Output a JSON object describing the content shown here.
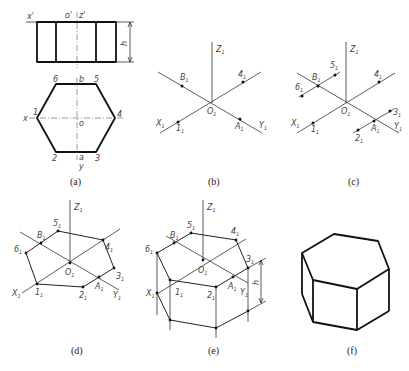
{
  "figure": {
    "panels": [
      {
        "id": "a",
        "caption": "(a)",
        "description": "Orthographic front and top views of hexagonal prism",
        "front_view_labels": {
          "x": "x'",
          "o": "o'",
          "z": "z'",
          "height": "h"
        },
        "top_view_labels": {
          "v1": "1",
          "v2": "2",
          "v3": "3",
          "v4": "4",
          "v5": "5",
          "v6": "6",
          "x": "x",
          "y": "y",
          "o": "o",
          "a": "a",
          "b": "b"
        }
      },
      {
        "id": "b",
        "caption": "(b)",
        "description": "Isometric axes with points B1, 4, 1, A1",
        "labels": {
          "z": "Z",
          "x": "X",
          "y": "Y",
          "o": "O",
          "b": "B",
          "a": "A",
          "p1": "1",
          "p4": "4"
        }
      },
      {
        "id": "c",
        "caption": "(c)",
        "description": "Lines through B1 and A1 parallel to X axis locate 5, 6, 2, 3",
        "labels": {
          "z": "Z",
          "x": "X",
          "y": "Y",
          "o": "O",
          "b": "B",
          "a": "A",
          "p1": "1",
          "p2": "2",
          "p3": "3",
          "p4": "4",
          "p5": "5",
          "p6": "6"
        }
      },
      {
        "id": "d",
        "caption": "(d)",
        "description": "Top hexagon connected in isometric",
        "labels": {
          "z": "Z",
          "x": "X",
          "y": "Y",
          "o": "O",
          "b": "B",
          "a": "A",
          "p1": "1",
          "p2": "2",
          "p3": "3",
          "p4": "4",
          "p5": "5",
          "p6": "6"
        }
      },
      {
        "id": "e",
        "caption": "(e)",
        "description": "Vertical edges drawn down by height h",
        "labels": {
          "z": "Z",
          "x": "X",
          "y": "Y",
          "o": "O",
          "b": "B",
          "a": "A",
          "p1": "1",
          "p2": "2",
          "p3": "3",
          "p4": "4",
          "p5": "5",
          "p6": "6",
          "height": "h"
        }
      },
      {
        "id": "f",
        "caption": "(f)",
        "description": "Finished isometric hexagonal prism"
      }
    ],
    "subscript": "1"
  }
}
